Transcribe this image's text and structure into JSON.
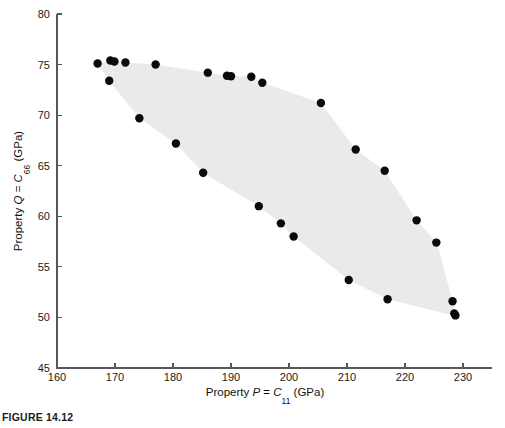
{
  "figure": {
    "caption": "FIGURE 14.12"
  },
  "chart_data": {
    "type": "scatter",
    "title": "",
    "xlabel": "Property P = C11 (GPa)",
    "ylabel": "Property Q = C66 (GPa)",
    "xlabel_parts": {
      "prefix": "Property ",
      "symbol": "P",
      "equals": " = ",
      "var": "C",
      "sub": "11",
      "units": " (GPa)"
    },
    "ylabel_parts": {
      "prefix": "Property ",
      "symbol": "Q",
      "equals": " = ",
      "var": "C",
      "sub": "66",
      "units": " (GPa)"
    },
    "xlim": [
      160,
      235
    ],
    "ylim": [
      45,
      80
    ],
    "xticks": [
      160,
      170,
      180,
      190,
      200,
      210,
      220,
      230
    ],
    "yticks": [
      45,
      50,
      55,
      60,
      65,
      70,
      75,
      80
    ],
    "xticklabels": [
      "160",
      "170",
      "180",
      "190",
      "200",
      "210",
      "220",
      "230"
    ],
    "yticklabels": [
      "45",
      "50",
      "55",
      "60",
      "65",
      "70",
      "75",
      "80"
    ],
    "grid": false,
    "legend": "none",
    "marker": {
      "shape": "circle",
      "color": "#0a0a0a",
      "size_px": 4.2
    },
    "shaded_region": {
      "label": "attainable property region",
      "fill_color": "#eaeaea",
      "vertices": [
        [
          167.0,
          75.1
        ],
        [
          169.5,
          75.4
        ],
        [
          171.8,
          75.2
        ],
        [
          177.0,
          75.0
        ],
        [
          186.0,
          74.2
        ],
        [
          189.6,
          73.9
        ],
        [
          193.5,
          73.8
        ],
        [
          195.5,
          73.2
        ],
        [
          205.5,
          71.2
        ],
        [
          211.5,
          66.6
        ],
        [
          216.5,
          64.5
        ],
        [
          222.0,
          59.6
        ],
        [
          225.5,
          57.4
        ],
        [
          228.2,
          51.6
        ],
        [
          228.6,
          50.4
        ],
        [
          228.3,
          50.2
        ],
        [
          217.0,
          51.8
        ],
        [
          210.3,
          53.7
        ],
        [
          200.8,
          58.0
        ],
        [
          198.6,
          59.3
        ],
        [
          194.8,
          61.0
        ],
        [
          185.2,
          64.3
        ],
        [
          180.5,
          67.2
        ],
        [
          174.2,
          69.7
        ],
        [
          169.0,
          73.4
        ]
      ]
    },
    "points": [
      [
        167.0,
        75.1
      ],
      [
        169.2,
        75.4
      ],
      [
        169.9,
        75.3
      ],
      [
        171.8,
        75.2
      ],
      [
        177.0,
        75.0
      ],
      [
        169.0,
        73.4
      ],
      [
        186.0,
        74.2
      ],
      [
        189.3,
        73.9
      ],
      [
        190.0,
        73.85
      ],
      [
        193.5,
        73.8
      ],
      [
        195.4,
        73.2
      ],
      [
        205.5,
        71.2
      ],
      [
        211.5,
        66.6
      ],
      [
        216.5,
        64.5
      ],
      [
        222.0,
        59.6
      ],
      [
        225.4,
        57.4
      ],
      [
        228.2,
        51.6
      ],
      [
        228.5,
        50.4
      ],
      [
        228.7,
        50.2
      ],
      [
        217.0,
        51.8
      ],
      [
        210.3,
        53.7
      ],
      [
        200.8,
        58.0
      ],
      [
        198.6,
        59.3
      ],
      [
        194.8,
        61.0
      ],
      [
        185.2,
        64.3
      ],
      [
        180.5,
        67.2
      ],
      [
        174.2,
        69.7
      ]
    ]
  }
}
